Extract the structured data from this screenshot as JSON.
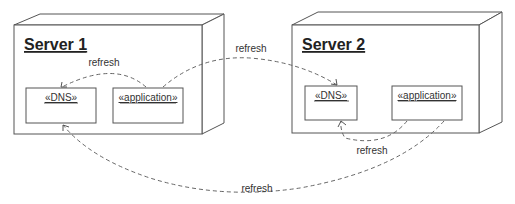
{
  "diagram": {
    "type": "UML deployment diagram",
    "nodes": [
      {
        "id": "server1",
        "title": "Server 1",
        "components": [
          {
            "id": "s1-dns",
            "label": "«DNS»"
          },
          {
            "id": "s1-app",
            "label": "«application»"
          }
        ]
      },
      {
        "id": "server2",
        "title": "Server 2",
        "components": [
          {
            "id": "s2-dns",
            "label": "«DNS»"
          },
          {
            "id": "s2-app",
            "label": "«application»"
          }
        ]
      }
    ],
    "edges": [
      {
        "from": "s1-app",
        "to": "s1-dns",
        "label": "refresh",
        "style": "dashed"
      },
      {
        "from": "s1-app",
        "to": "s2-dns",
        "label": "refresh",
        "style": "dashed"
      },
      {
        "from": "s2-app",
        "to": "s2-dns",
        "label": "refresh",
        "style": "dashed"
      },
      {
        "from": "s2-app",
        "to": "s1-dns",
        "label": "refresh",
        "style": "dashed"
      }
    ]
  }
}
